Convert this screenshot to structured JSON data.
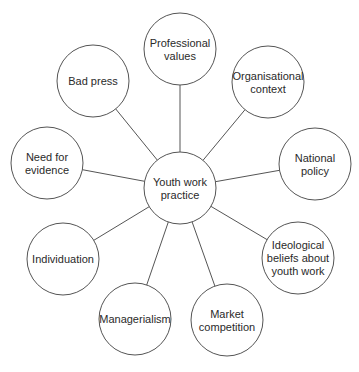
{
  "diagram": {
    "type": "hub-and-spoke",
    "colors": {
      "line": "#555555",
      "fill": "#ffffff",
      "text": "#2a2a2a"
    },
    "center": {
      "id": "center",
      "lines": [
        "Youth work",
        "practice"
      ],
      "cx": 180,
      "cy": 188,
      "r": 36
    },
    "nodes": [
      {
        "id": "professional-values",
        "lines": [
          "Professional",
          "values"
        ],
        "cx": 180,
        "cy": 49,
        "r": 36
      },
      {
        "id": "organisational-context",
        "lines": [
          "Organisational",
          "context"
        ],
        "cx": 268,
        "cy": 82,
        "r": 36
      },
      {
        "id": "national-policy",
        "lines": [
          "National",
          "policy"
        ],
        "cx": 315,
        "cy": 164,
        "r": 36
      },
      {
        "id": "ideological-beliefs",
        "lines": [
          "Ideological",
          "beliefs about",
          "youth work"
        ],
        "cx": 298,
        "cy": 258,
        "r": 36
      },
      {
        "id": "market-competition",
        "lines": [
          "Market",
          "competition"
        ],
        "cx": 227,
        "cy": 320,
        "r": 36
      },
      {
        "id": "managerialism",
        "lines": [
          "Managerialism"
        ],
        "cx": 135,
        "cy": 319,
        "r": 36
      },
      {
        "id": "individuation",
        "lines": [
          "Individuation"
        ],
        "cx": 63,
        "cy": 259,
        "r": 36
      },
      {
        "id": "need-for-evidence",
        "lines": [
          "Need for",
          "evidence"
        ],
        "cx": 47,
        "cy": 163,
        "r": 36
      },
      {
        "id": "bad-press",
        "lines": [
          "Bad press"
        ],
        "cx": 93,
        "cy": 81,
        "r": 36
      }
    ]
  }
}
